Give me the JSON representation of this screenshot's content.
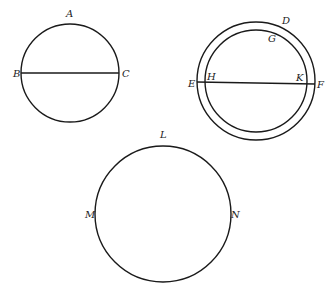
{
  "diagram": {
    "colors": {
      "line": "#1a1a1a",
      "label": "#222222",
      "background": "#ffffff"
    },
    "figures": [
      {
        "name": "circle-ABC",
        "circles": [
          {
            "cx": 70,
            "cy": 73,
            "r": 49
          }
        ],
        "lines": [
          {
            "x1": 21,
            "y1": 73,
            "x2": 119,
            "y2": 73
          }
        ],
        "labels": [
          {
            "text": "A",
            "x": 66,
            "y": 17
          },
          {
            "text": "B",
            "x": 13,
            "y": 77
          },
          {
            "text": "C",
            "x": 122,
            "y": 77
          }
        ]
      },
      {
        "name": "concentric-circles-DEFGHK",
        "circles": [
          {
            "cx": 256,
            "cy": 81,
            "r": 59
          },
          {
            "cx": 256,
            "cy": 81,
            "r": 51
          }
        ],
        "lines": [
          {
            "x1": 197,
            "y1": 82,
            "x2": 315,
            "y2": 84
          }
        ],
        "labels": [
          {
            "text": "D",
            "x": 282,
            "y": 24
          },
          {
            "text": "G",
            "x": 268,
            "y": 42
          },
          {
            "text": "E",
            "x": 188,
            "y": 87
          },
          {
            "text": "H",
            "x": 207,
            "y": 80
          },
          {
            "text": "K",
            "x": 296,
            "y": 81
          },
          {
            "text": "F",
            "x": 317,
            "y": 88
          }
        ]
      },
      {
        "name": "circle-LMN",
        "circles": [
          {
            "cx": 163,
            "cy": 214,
            "r": 68
          }
        ],
        "lines": [],
        "labels": [
          {
            "text": "L",
            "x": 160,
            "y": 138
          },
          {
            "text": "M",
            "x": 85,
            "y": 218
          },
          {
            "text": "N",
            "x": 231,
            "y": 218
          }
        ]
      }
    ]
  }
}
